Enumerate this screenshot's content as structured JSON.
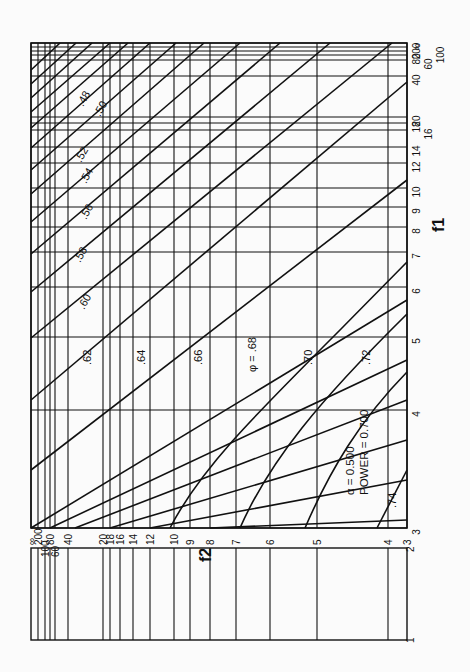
{
  "chart_data": {
    "type": "line",
    "orientation": "rotated 90 degrees clockwise",
    "xlabel": "f1",
    "ylabel": "f2",
    "annotation": {
      "alpha": "α = 0.500",
      "power": "POWER = 0.700",
      "phi_label": "φ = .68"
    },
    "f1_ticks": [
      "3",
      "4",
      "5",
      "6",
      "7",
      "8",
      "9",
      "10",
      "12",
      "14",
      "16",
      "18",
      "20",
      "40",
      "60",
      "80",
      "100",
      "200",
      "∞"
    ],
    "f2_ticks": [
      "3",
      "4",
      "5",
      "6",
      "7",
      "8",
      "9",
      "10",
      "12",
      "14",
      "16",
      "18",
      "20",
      "40",
      "60",
      "80",
      "100",
      "200",
      "∞"
    ],
    "f2_strip_ticks": [
      "1",
      "2"
    ],
    "series": [
      {
        "name": ".48",
        "label": ".48"
      },
      {
        "name": ".50",
        "label": ".50"
      },
      {
        "name": ".52",
        "label": ".52"
      },
      {
        "name": ".54",
        "label": ".54"
      },
      {
        "name": ".56",
        "label": ".56"
      },
      {
        "name": ".58",
        "label": ".58"
      },
      {
        "name": ".60",
        "label": ".60"
      },
      {
        "name": ".62",
        "label": ".62"
      },
      {
        "name": ".64",
        "label": ".64"
      },
      {
        "name": ".66",
        "label": ".66"
      },
      {
        "name": ".68",
        "label": "φ = .68"
      },
      {
        "name": ".70",
        "label": ".70"
      },
      {
        "name": ".72",
        "label": ".72"
      },
      {
        "name": ".74",
        "label": ".74"
      }
    ]
  },
  "geometry": {
    "frame": {
      "x0": 31,
      "x1": 407,
      "y0": 43,
      "y1": 528
    },
    "f2_grid_x": {
      "∞": 31,
      "200": 38,
      "100": 45,
      "80": 50,
      "60": 55,
      "40": 68,
      "20": 103,
      "18": 110,
      "16": 120,
      "14": 133,
      "12": 150,
      "10": 174,
      "9": 190,
      "8": 210,
      "7": 236,
      "6": 270,
      "5": 317,
      "4": 388,
      "3": 407
    },
    "f1_grid_y": {
      "∞": 43,
      "200": 47,
      "100": 51,
      "80": 55,
      "60": 60,
      "40": 76,
      "20": 117,
      "18": 123,
      "16": 130,
      "14": 147,
      "12": 163,
      "10": 188,
      "9": 207,
      "8": 227,
      "7": 252,
      "6": 287,
      "5": 337,
      "4": 410,
      "3": 528
    },
    "curves": [
      [
        [
          31,
          70
        ],
        [
          60,
          43
        ]
      ],
      [
        [
          31,
          84
        ],
        [
          76,
          43
        ]
      ],
      [
        [
          31,
          98
        ],
        [
          92,
          43
        ]
      ],
      [
        [
          31,
          112
        ],
        [
          110,
          43
        ]
      ],
      [
        [
          31,
          128
        ],
        [
          128,
          43
        ]
      ],
      [
        [
          31,
          148
        ],
        [
          150,
          43
        ]
      ],
      [
        [
          31,
          170
        ],
        [
          176,
          43
        ]
      ],
      [
        [
          31,
          194
        ],
        [
          204,
          43
        ]
      ],
      [
        [
          31,
          222
        ],
        [
          240,
          43
        ]
      ],
      [
        [
          31,
          254
        ],
        [
          280,
          43
        ]
      ],
      [
        [
          31,
          292
        ],
        [
          330,
          43
        ]
      ],
      [
        [
          31,
          338
        ],
        [
          392,
          43
        ]
      ],
      [
        [
          31,
          400
        ],
        [
          407,
          82
        ]
      ],
      [
        [
          31,
          470
        ],
        [
          407,
          180
        ]
      ],
      [
        [
          31,
          528
        ],
        [
          407,
          300
        ]
      ],
      [
        [
          50,
          528
        ],
        [
          407,
          360
        ]
      ],
      [
        [
          75,
          528
        ],
        [
          407,
          400
        ]
      ],
      [
        [
          110,
          528
        ],
        [
          407,
          440
        ]
      ],
      [
        [
          150,
          528
        ],
        [
          407,
          480
        ]
      ],
      [
        [
          210,
          528
        ],
        [
          407,
          520
        ]
      ]
    ],
    "real_curves": [
      {
        "d": "M 170 528 C 200 470, 250 420, 340 330 L 407 262"
      },
      {
        "d": "M 240 528 C 270 460, 320 400, 407 314"
      },
      {
        "d": "M 305 528 C 330 470, 360 420, 407 372"
      },
      {
        "d": "M 377 528 L 407 470"
      }
    ]
  }
}
